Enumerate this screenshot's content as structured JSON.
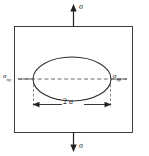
{
  "figure": {
    "background_color": "#ffffff",
    "line_color": "#2b2b2b",
    "plate": {
      "shape": "rectangle",
      "x": 14,
      "y": 26,
      "width": 119,
      "height": 107
    },
    "crack": {
      "shape": "ellipse",
      "center_x": 72,
      "center_y": 79,
      "semi_major_a": 39,
      "semi_minor_b": 22
    },
    "labels": {
      "sigma_top": {
        "symbol": "σ",
        "subscript": "",
        "meaning": "applied-tensile-stress"
      },
      "sigma_bottom": {
        "symbol": "σ",
        "subscript": "",
        "meaning": "applied-tensile-stress"
      },
      "sigma_tip_left": {
        "symbol": "σ",
        "subscript": "tip",
        "meaning": "crack-tip-stress"
      },
      "sigma_tip_right": {
        "symbol": "σ",
        "subscript": "tip",
        "meaning": "crack-tip-stress"
      },
      "crack_length": {
        "number": "2",
        "symbol": "a",
        "meaning": "crack-length"
      }
    },
    "arrows": {
      "load_top": {
        "direction": "up",
        "x": 73,
        "from_y": 26,
        "to_y": 5
      },
      "load_bottom": {
        "direction": "down",
        "x": 73,
        "from_y": 133,
        "to_y": 152
      },
      "dimension": {
        "direction": "double-headed-horizontal",
        "y": 104,
        "from_x": 33,
        "to_x": 111
      }
    }
  }
}
